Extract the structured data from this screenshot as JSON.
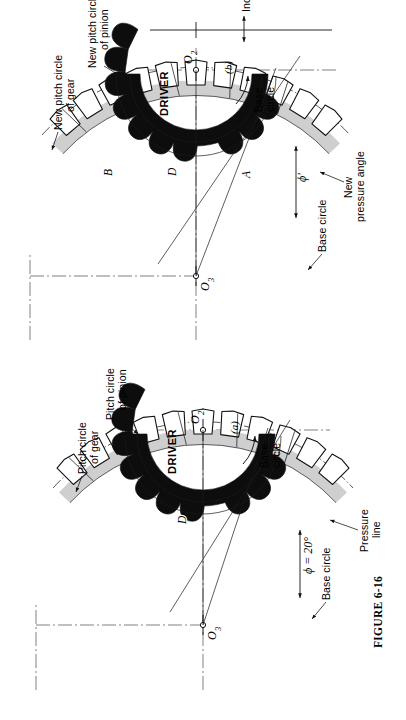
{
  "figure": {
    "caption": "FIGURE 6-16",
    "panels": [
      {
        "id": "a",
        "tag": "(a)",
        "centers": {
          "gear": "O3",
          "pinion": "O2"
        },
        "driver_label": "DRIVER",
        "points": [
          "P",
          "D"
        ],
        "annotations": {
          "base_circle_gear": "Base circle",
          "pitch_circle_gear": "Pitch circle\nof gear",
          "pitch_circle_gear_l1": "Pitch circle",
          "pitch_circle_gear_l2": "of gear",
          "pitch_circle_pinion_l1": "Pitch circle",
          "pitch_circle_pinion_l2": "of pinion",
          "base_circle_pinion_l1": "Base",
          "base_circle_pinion_l2": "circle",
          "pressure_line_l1": "Pressure",
          "pressure_line_l2": "line",
          "pressure_angle": "ϕ = 20°"
        }
      },
      {
        "id": "b",
        "tag": "(b)",
        "centers": {
          "gear": "O3",
          "pinion": "O2"
        },
        "driver_label": "DRIVER",
        "points": [
          "A",
          "P",
          "D",
          "B"
        ],
        "annotations": {
          "base_circle_gear": "Base circle",
          "new_pitch_circle_gear_l1": "New pitch circle",
          "new_pitch_circle_gear_l2": "of gear",
          "new_pitch_circle_pinion_l1": "New pitch circle",
          "new_pitch_circle_pinion_l2": "of pinion",
          "base_circle_pinion_l1": "Base",
          "base_circle_pinion_l2": "circle",
          "new_pressure_angle_l1": "New",
          "new_pressure_angle_l2": "pressure angle",
          "new_pressure_angle_symbol": "ϕ'",
          "increase_center_distance": "Increase in center distance"
        }
      }
    ],
    "subscripts": {
      "two": "2",
      "three": "3"
    },
    "center_letter": "O"
  },
  "colors": {
    "ink": "#111111",
    "gear_rim_gray": "#cfcfcf",
    "pinion_black": "#0d0d0d",
    "paper": "#ffffff"
  }
}
